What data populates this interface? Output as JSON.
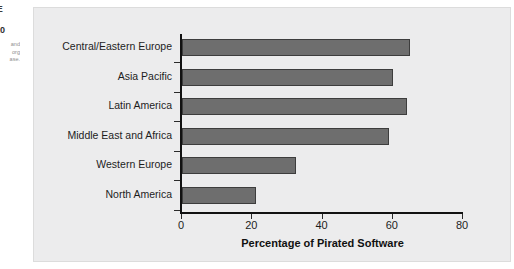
{
  "margin_caption": {
    "heading_fragment": "RE",
    "number_fragment": "010",
    "body_lines": [
      "and",
      "org",
      "ase."
    ]
  },
  "chart_data": {
    "type": "bar",
    "orientation": "horizontal",
    "title": "",
    "categories": [
      "Central/Eastern Europe",
      "Asia Pacific",
      "Latin America",
      "Middle East and Africa",
      "Western Europe",
      "North America"
    ],
    "values": [
      65,
      60,
      64,
      59,
      32.5,
      21
    ],
    "xlabel": "Percentage of Pirated Software",
    "ylabel": "",
    "xlim": [
      0,
      80
    ],
    "xticks": [
      0,
      20,
      40,
      60,
      80
    ],
    "grid": false,
    "legend": "none",
    "bar_color": "#6e6e6e",
    "bar_edge_color": "#3d3d3d",
    "panel_background": "#ececed"
  }
}
